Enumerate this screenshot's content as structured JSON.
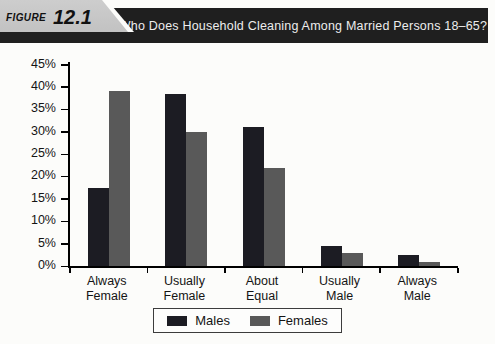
{
  "header": {
    "figure_word": "FIGURE",
    "figure_number": "12.1",
    "title": "Who Does Household Cleaning Among Married Persons 18–65?"
  },
  "chart_data": {
    "type": "bar",
    "title": "Who Does Household Cleaning Among Married Persons 18–65?",
    "categories": [
      "Always Female",
      "Usually Female",
      "About Equal",
      "Usually Male",
      "Always Male"
    ],
    "series": [
      {
        "name": "Males",
        "color": "#1c1c23",
        "values": [
          17.5,
          38.5,
          31,
          4.5,
          2.5
        ]
      },
      {
        "name": "Females",
        "color": "#595959",
        "values": [
          39,
          30,
          22,
          3,
          1
        ]
      }
    ],
    "xlabel": "",
    "ylabel": "",
    "ylim": [
      0,
      45
    ],
    "ytick_step": 5,
    "ytick_labels": [
      "0%",
      "5%",
      "10%",
      "15%",
      "20%",
      "25%",
      "30%",
      "35%",
      "40%",
      "45%"
    ],
    "grid": false,
    "legend_position": "bottom"
  },
  "colors": {
    "banner_bg": "#1f1f1f",
    "banner_text": "#ededed",
    "figure_label_bg": "#c7c7c7",
    "males": "#1c1c23",
    "females": "#595959",
    "axis": "#000000",
    "page_bg": "#fcfcfa"
  }
}
